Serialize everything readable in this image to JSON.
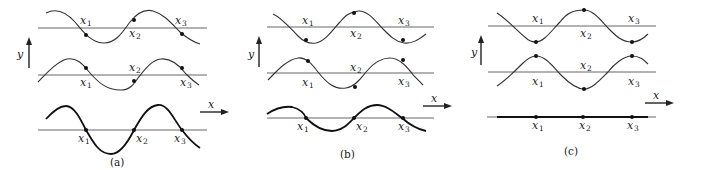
{
  "figure": {
    "panels": [
      {
        "id": "a",
        "caption": "(a)",
        "y_axis_label": "y",
        "x_axis_label": "x",
        "rows": [
          {
            "row": "top",
            "point_labels": [
              "x",
              "x",
              "x"
            ],
            "subscripts": [
              "1",
              "2",
              "3"
            ]
          },
          {
            "row": "middle",
            "point_labels": [
              "x",
              "x",
              "x"
            ],
            "subscripts": [
              "1",
              "2",
              "3"
            ]
          },
          {
            "row": "bottom",
            "point_labels": [
              "x",
              "x",
              "x"
            ],
            "subscripts": [
              "1",
              "2",
              "3"
            ]
          }
        ]
      },
      {
        "id": "b",
        "caption": "(b)",
        "y_axis_label": "y",
        "x_axis_label": "x",
        "rows": [
          {
            "row": "top",
            "point_labels": [
              "x",
              "x",
              "x"
            ],
            "subscripts": [
              "1",
              "2",
              "3"
            ]
          },
          {
            "row": "middle",
            "point_labels": [
              "x",
              "x",
              "x"
            ],
            "subscripts": [
              "1",
              "2",
              "3"
            ]
          },
          {
            "row": "bottom",
            "point_labels": [
              "x",
              "x",
              "x"
            ],
            "subscripts": [
              "1",
              "2",
              "3"
            ]
          }
        ]
      },
      {
        "id": "c",
        "caption": "(c)",
        "y_axis_label": "y",
        "x_axis_label": "x",
        "rows": [
          {
            "row": "top",
            "point_labels": [
              "x",
              "x",
              "x"
            ],
            "subscripts": [
              "1",
              "2",
              "3"
            ]
          },
          {
            "row": "middle",
            "point_labels": [
              "x",
              "x",
              "x"
            ],
            "subscripts": [
              "1",
              "2",
              "3"
            ]
          },
          {
            "row": "bottom",
            "point_labels": [
              "x",
              "x",
              "x"
            ],
            "subscripts": [
              "1",
              "2",
              "3"
            ]
          }
        ]
      }
    ]
  }
}
